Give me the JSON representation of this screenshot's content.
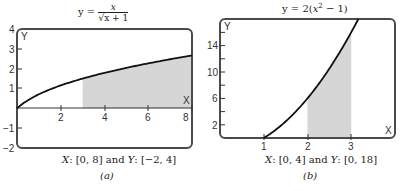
{
  "chart_data": [
    {
      "type": "line",
      "panel": "(a)",
      "title": "y = x / √(x + 1)",
      "function": "x / sqrt(x + 1)",
      "xlabel": "X",
      "ylabel": "Y",
      "xlim": [
        0,
        8
      ],
      "ylim": [
        -2,
        4
      ],
      "xticks": [
        2,
        4,
        6,
        8
      ],
      "yticks": [
        -2,
        -1,
        1,
        2,
        3,
        4
      ],
      "shaded_region": {
        "x_from": 3,
        "x_to": 8
      },
      "window_caption": "X: [0, 8] and Y: [-2, 4]",
      "x": [
        0,
        1,
        2,
        3,
        4,
        5,
        6,
        7,
        8
      ],
      "values": [
        0,
        0.71,
        1.15,
        1.5,
        1.79,
        2.04,
        2.27,
        2.47,
        2.67
      ]
    },
    {
      "type": "line",
      "panel": "(b)",
      "title": "y = 2(x² − 1)",
      "function": "2*(x^2 - 1)",
      "xlabel": "X",
      "ylabel": "Y",
      "xlim": [
        0,
        4
      ],
      "ylim": [
        0,
        18
      ],
      "xticks": [
        1,
        2,
        3
      ],
      "yticks": [
        2,
        6,
        10,
        14
      ],
      "shaded_region": {
        "x_from": 2,
        "x_to": 3
      },
      "window_caption": "X: [0, 4] and Y: [0, 18]",
      "x": [
        1,
        1.5,
        2,
        2.5,
        3,
        3.16
      ],
      "values": [
        0,
        2.5,
        6,
        10.5,
        16,
        18
      ]
    }
  ],
  "panels": {
    "a": {
      "title_lhs": "y =",
      "title_num": "x",
      "title_den": "√x + 1",
      "axis_x_label": "X",
      "axis_y_label": "Y",
      "xtick_labels": [
        "2",
        "4",
        "6",
        "8"
      ],
      "ytick_labels": [
        "4",
        "3",
        "2",
        "1",
        "−1",
        "−2"
      ],
      "caption": "X: [0, 8] and Y: [−2, 4]",
      "sublabel": "(a)"
    },
    "b": {
      "title": "y = 2(x² − 1)",
      "axis_x_label": "X",
      "axis_y_label": "Y",
      "xtick_labels": [
        "1",
        "2",
        "3"
      ],
      "ytick_labels": [
        "14",
        "10",
        "6",
        "2"
      ],
      "caption": "X: [0, 4] and Y: [0, 18]",
      "sublabel": "(b)"
    }
  },
  "colors": {
    "frame": "#4a4a4a",
    "curve": "#111111",
    "shade": "#d6d6d6"
  }
}
